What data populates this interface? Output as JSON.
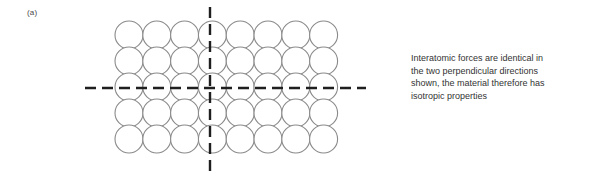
{
  "figure": {
    "panel_label": "(a)",
    "caption_lines": [
      "Interatomic forces are identical in",
      "the two perpendicular directions",
      "shown, the material therefore has",
      "isotropic properties"
    ],
    "caption_full": "Interatomic forces are identical in the two perpendicular directions shown, the material therefore has isotropic properties"
  },
  "colors": {
    "atom_stroke": "#8a8a8a",
    "atom_fill": "#ffffff",
    "axis_line": "#1f1f1f",
    "label_text": "#4a4a4a",
    "caption_text": "#333333",
    "background": "#ffffff"
  },
  "chart_data": {
    "type": "diagram",
    "lattice": {
      "columns": 8,
      "rows": 5,
      "atom_diameter_px": 28,
      "column_pitch_px": 27.8,
      "row_pitch_px": 26.0,
      "origin_x_px": 37,
      "origin_y_px": 21,
      "atom_count": 40
    },
    "axes": [
      {
        "name": "horizontal-axis",
        "orientation": "horizontal",
        "y_px": 88,
        "x_start_px": 7,
        "x_end_px": 288,
        "style": "dashed",
        "dash_px": 11,
        "gap_px": 6,
        "width_px": 2.4
      },
      {
        "name": "vertical-axis",
        "orientation": "vertical",
        "x_px": 132,
        "y_start_px": 7,
        "y_end_px": 173,
        "style": "dashed",
        "dash_px": 11,
        "gap_px": 6,
        "width_px": 2.4
      }
    ],
    "annotations": [
      {
        "name": "panel-label",
        "text": "(a)",
        "x_px": 27,
        "y_px": 12
      },
      {
        "name": "caption",
        "text": "Interatomic forces are identical in the two perpendicular directions shown, the material therefore has isotropic properties",
        "x_px": 411,
        "y_px": 58
      }
    ],
    "grid": false,
    "legend": null
  }
}
